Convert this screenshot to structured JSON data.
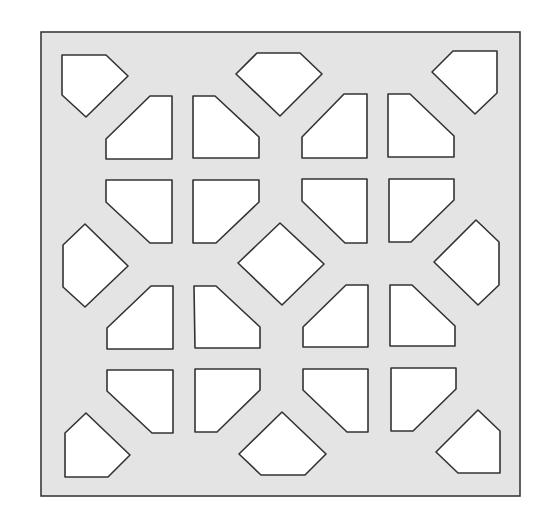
{
  "diagram": {
    "type": "lattice-panel",
    "colors": {
      "panel_fill": "#e4e4e4",
      "panel_stroke": "#3a3a3a",
      "hole_fill": "#ffffff",
      "hole_stroke": "#333333",
      "background": "#ffffff"
    },
    "panel": {
      "x": 41,
      "y": 32,
      "width": 479,
      "height": 464
    },
    "holes": [
      {
        "name": "corner-top-left",
        "points": "62,55 106,55 128,76 86,117 62,95"
      },
      {
        "name": "top-center",
        "points": "257,53 300,53 322,74 280,116 236,74"
      },
      {
        "name": "corner-top-right",
        "points": "453,51 497,51 497,93 475,114 432,72"
      },
      {
        "name": "left-group-r1-c1",
        "points": "150,96 172,96 172,159 106,159 106,139"
      },
      {
        "name": "left-group-r1-c2",
        "points": "193,96 215,96 259,137 259,158 193,158"
      },
      {
        "name": "left-group-r2-c1",
        "points": "106,180 172,180 172,243 150,243 106,202"
      },
      {
        "name": "left-group-r2-c2",
        "points": "193,180 259,180 259,202 216,243 193,243"
      },
      {
        "name": "right-group-r1-c1",
        "points": "344,94 367,94 367,158 302,158 302,137"
      },
      {
        "name": "right-group-r1-c2",
        "points": "388,94 410,94 454,136 454,157 388,157"
      },
      {
        "name": "right-group-r2-c1",
        "points": "302,179 367,179 367,243 345,243 302,201"
      },
      {
        "name": "right-group-r2-c2",
        "points": "389,179 454,179 454,200 411,242 389,242"
      },
      {
        "name": "middle-left",
        "points": "63,245 85,224 128,266 85,307 63,287"
      },
      {
        "name": "center-diamond",
        "points": "280,223 324,264 282,305 238,263"
      },
      {
        "name": "middle-right",
        "points": "476,220 499,242 499,285 478,305 434,262"
      },
      {
        "name": "left-group-r3-c1",
        "points": "151,286 173,286 173,349 107,349 107,328"
      },
      {
        "name": "left-group-r3-c2",
        "points": "194,286 216,286 260,327 260,348 195,348"
      },
      {
        "name": "left-group-r4-c1",
        "points": "107,370 173,370 173,433 152,433 107,391"
      },
      {
        "name": "left-group-r4-c2",
        "points": "195,369 260,369 260,390 217,432 195,432"
      },
      {
        "name": "right-group-r3-c1",
        "points": "346,285 368,285 368,347 303,347 303,327"
      },
      {
        "name": "right-group-r3-c2",
        "points": "390,285 412,285 455,326 455,346 390,346"
      },
      {
        "name": "right-group-r4-c1",
        "points": "303,369 368,369 368,432 347,432 303,390"
      },
      {
        "name": "right-group-r4-c2",
        "points": "391,368 456,368 456,389 413,431 391,431"
      },
      {
        "name": "corner-bottom-left",
        "points": "86,413 130,455 108,477 65,477 65,433"
      },
      {
        "name": "bottom-center",
        "points": "282,412 326,454 305,475 261,475 239,454"
      },
      {
        "name": "corner-bottom-right",
        "points": "478,410 500,431 500,473 458,473 436,452"
      }
    ]
  }
}
